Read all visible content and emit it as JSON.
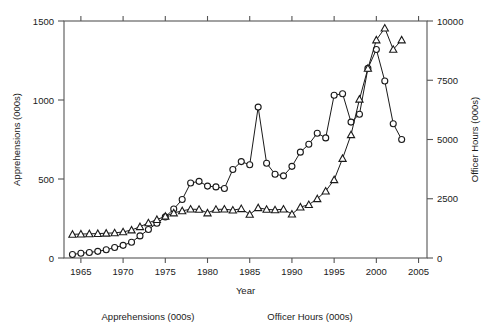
{
  "chart_data": {
    "type": "line",
    "title": "",
    "xlabel": "Year",
    "ylabel": "Apprehensions (000s)",
    "y2label": "Officer Hours (000s)",
    "grid": false,
    "legend_position": "below-axis",
    "xlim": [
      1963,
      2006
    ],
    "ylim": [
      0,
      1500
    ],
    "y2lim": [
      0,
      10000
    ],
    "xticks": [
      "1965",
      "1970",
      "1975",
      "1980",
      "1985",
      "1990",
      "1995",
      "2000",
      "2005"
    ],
    "xtick_values": [
      1965,
      1970,
      1975,
      1980,
      1985,
      1990,
      1995,
      2000,
      2005
    ],
    "yticks": [
      "0",
      "500",
      "1000",
      "1500"
    ],
    "ytick_values": [
      0,
      500,
      1000,
      1500
    ],
    "y2ticks": [
      "0",
      "2500",
      "5000",
      "7500",
      "10000"
    ],
    "y2tick_values": [
      0,
      2500,
      5000,
      7500,
      10000
    ],
    "x": [
      1964,
      1965,
      1966,
      1967,
      1968,
      1969,
      1970,
      1971,
      1972,
      1973,
      1974,
      1975,
      1976,
      1977,
      1978,
      1979,
      1980,
      1981,
      1982,
      1983,
      1984,
      1985,
      1986,
      1987,
      1988,
      1989,
      1990,
      1991,
      1992,
      1993,
      1994,
      1995,
      1996,
      1997,
      1998,
      1999,
      2000,
      2001,
      2002,
      2003
    ],
    "series": [
      {
        "name": "Apprehensions (000s)",
        "marker": "circle",
        "axis": "left",
        "unit": "000s",
        "values": [
          22,
          30,
          35,
          42,
          52,
          66,
          80,
          100,
          140,
          180,
          220,
          260,
          310,
          370,
          475,
          485,
          455,
          450,
          440,
          560,
          610,
          590,
          955,
          600,
          530,
          520,
          580,
          670,
          720,
          790,
          760,
          1030,
          1040,
          860,
          910,
          1200,
          1320,
          1120,
          850,
          750
        ]
      },
      {
        "name": "Officer Hours (000s)",
        "marker": "triangle",
        "axis": "right",
        "unit": "000s",
        "values": [
          1000,
          1010,
          1020,
          1030,
          1045,
          1060,
          1100,
          1180,
          1320,
          1480,
          1620,
          1760,
          1900,
          1990,
          2060,
          2050,
          1900,
          2050,
          2060,
          2020,
          2080,
          1840,
          2120,
          2050,
          2030,
          2060,
          1850,
          2150,
          2250,
          2500,
          2820,
          3300,
          4200,
          5200,
          6700,
          8000,
          9200,
          9700,
          8800,
          9200
        ]
      }
    ],
    "legend_entries": [
      {
        "label": "Apprehensions (000s)",
        "marker": "circle"
      },
      {
        "label": "Officer Hours (000s)",
        "marker": "triangle"
      }
    ],
    "colors": {
      "line": "#1a1a1a",
      "frame": "#555555",
      "marker_fill": "#ffffff",
      "background": "#ffffff"
    }
  }
}
